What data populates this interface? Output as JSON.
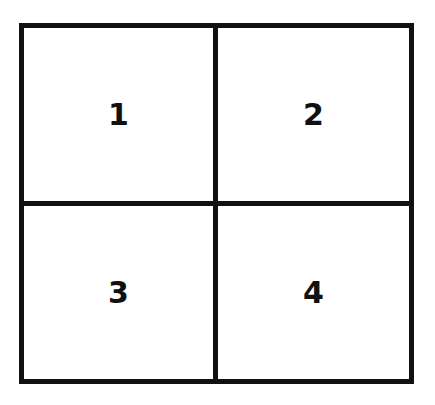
{
  "diagram": {
    "type": "2x2 grid",
    "cells": [
      {
        "label": "1"
      },
      {
        "label": "2"
      },
      {
        "label": "3"
      },
      {
        "label": "4"
      }
    ],
    "colors": {
      "line": "#111111",
      "background": "#ffffff"
    }
  }
}
